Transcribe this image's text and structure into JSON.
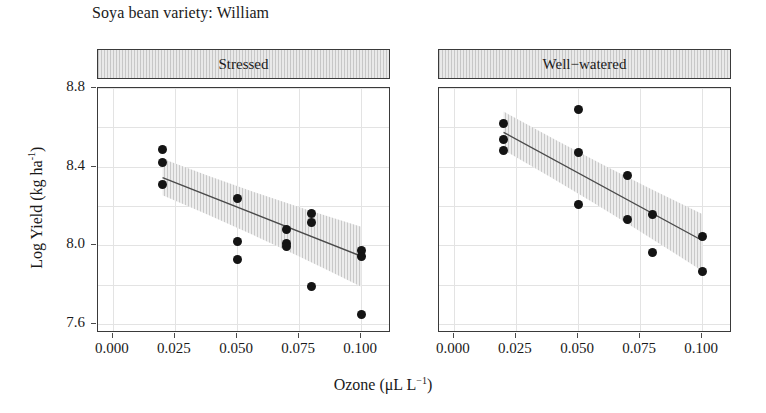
{
  "chart_data": {
    "type": "scatter",
    "title": "Soya bean variety: William",
    "xlabel_text": "Ozone (μL L",
    "xlabel_sup": "−1",
    "xlabel_tail": ")",
    "xlabel": "Ozone (μL L⁻¹)",
    "ylabel_text": "Log Yield (kg ha",
    "ylabel_sup": "-1",
    "ylabel_tail": ")",
    "ylabel": "Log Yield (kg ha⁻¹)",
    "xlim": [
      -0.006,
      0.112
    ],
    "ylim": [
      7.555,
      8.8
    ],
    "xticks": [
      0.0,
      0.025,
      0.05,
      0.075,
      0.1
    ],
    "xtick_labels": [
      "0.000",
      "0.025",
      "0.050",
      "0.075",
      "0.100"
    ],
    "yticks": [
      7.6,
      8.0,
      8.4,
      8.8
    ],
    "ytick_labels": [
      "7.6",
      "8.0",
      "8.4",
      "8.8"
    ],
    "grid": true,
    "grid_color": "#e3e3e3",
    "point_color": "#141414",
    "line_color": "#4a4a4a",
    "band_color": "#dddddd",
    "strip_fill": "#e9e9e9",
    "panels": [
      {
        "label": "Stressed",
        "points": [
          {
            "x": 0.02,
            "y": 8.49
          },
          {
            "x": 0.02,
            "y": 8.42
          },
          {
            "x": 0.02,
            "y": 8.31
          },
          {
            "x": 0.05,
            "y": 8.24
          },
          {
            "x": 0.05,
            "y": 8.02
          },
          {
            "x": 0.05,
            "y": 7.93
          },
          {
            "x": 0.07,
            "y": 8.08
          },
          {
            "x": 0.07,
            "y": 8.01
          },
          {
            "x": 0.07,
            "y": 7.995
          },
          {
            "x": 0.08,
            "y": 8.16
          },
          {
            "x": 0.08,
            "y": 8.115
          },
          {
            "x": 0.08,
            "y": 7.79
          },
          {
            "x": 0.1,
            "y": 7.975
          },
          {
            "x": 0.1,
            "y": 7.945
          },
          {
            "x": 0.1,
            "y": 7.65
          }
        ],
        "fit": {
          "x0": 0.02,
          "y0": 8.345,
          "x1": 0.1,
          "y1": 7.945
        },
        "band": {
          "x0": 0.02,
          "lo0": 8.255,
          "hi0": 8.44,
          "x1": 0.1,
          "lo1": 7.79,
          "hi1": 8.095
        }
      },
      {
        "label": "Well−watered",
        "points": [
          {
            "x": 0.02,
            "y": 8.62
          },
          {
            "x": 0.02,
            "y": 8.54
          },
          {
            "x": 0.02,
            "y": 8.48
          },
          {
            "x": 0.05,
            "y": 8.69
          },
          {
            "x": 0.05,
            "y": 8.47
          },
          {
            "x": 0.05,
            "y": 8.21
          },
          {
            "x": 0.07,
            "y": 8.355
          },
          {
            "x": 0.07,
            "y": 8.13
          },
          {
            "x": 0.08,
            "y": 8.155
          },
          {
            "x": 0.08,
            "y": 7.965
          },
          {
            "x": 0.1,
            "y": 8.045
          },
          {
            "x": 0.1,
            "y": 7.865
          }
        ],
        "fit": {
          "x0": 0.02,
          "y0": 8.575,
          "x1": 0.1,
          "y1": 8.025
        },
        "band": {
          "x0": 0.02,
          "lo0": 8.485,
          "hi0": 8.68,
          "x1": 0.1,
          "lo1": 7.87,
          "hi1": 8.16
        }
      }
    ]
  }
}
